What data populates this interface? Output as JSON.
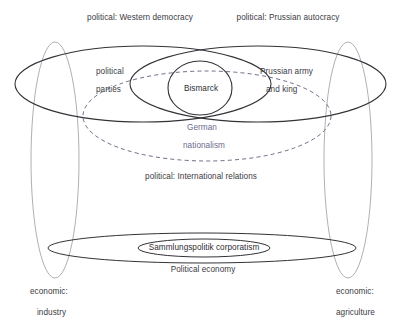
{
  "diagram": {
    "title_region": "Bismarck-era German politics Venn diagram",
    "colors": {
      "background": "#ffffff",
      "primary_stroke": "#333338",
      "light_stroke": "#9a9aa2",
      "dashed_stroke": "#5c5c78",
      "text": "#3b3b44",
      "accent_text": "#6b6b8c"
    },
    "labels": {
      "top_left": "political:  Western democracy",
      "top_right": "political: Prussian autocracy",
      "left_inner_line1": "political",
      "left_inner_line2": "parties",
      "center_node": "Bismarck",
      "right_inner_line1": "Prussian army",
      "right_inner_line2": "and king",
      "dashed_line1": "German",
      "dashed_line2": "nationalism",
      "middle_caption": "political: International relations",
      "bottom_inner": "Sammlungspolitik corporatism",
      "bottom_caption": "Political economy",
      "bottom_left_line1": "economic:",
      "bottom_left_line2": "industry",
      "bottom_right_line1": "economic:",
      "bottom_right_line2": "agriculture"
    },
    "shapes": {
      "left_big_ellipse": {
        "cx": 143,
        "cy": 84,
        "rx": 128,
        "ry": 38
      },
      "right_big_ellipse": {
        "cx": 258,
        "cy": 84,
        "rx": 128,
        "ry": 38
      },
      "center_ellipse": {
        "cx": 200,
        "cy": 88,
        "rx": 32,
        "ry": 27
      },
      "dashed_ellipse": {
        "cx": 207,
        "cy": 116,
        "rx": 124,
        "ry": 45
      },
      "left_vertical_ellipse": {
        "cx": 55,
        "cy": 160,
        "rx": 24,
        "ry": 118
      },
      "right_vertical_ellipse": {
        "cx": 348,
        "cy": 160,
        "rx": 24,
        "ry": 118
      },
      "bottom_wide_ellipse": {
        "cx": 202,
        "cy": 248,
        "rx": 154,
        "ry": 15
      },
      "bottom_inner_ellipse": {
        "cx": 204,
        "cy": 248,
        "rx": 66,
        "ry": 9
      }
    }
  }
}
